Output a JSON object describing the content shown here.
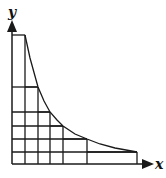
{
  "diagram": {
    "type": "riemann-rectangles-under-decreasing-curve",
    "labels": {
      "y_axis": "y",
      "x_axis": "x"
    },
    "colors": {
      "stroke": "#1a1a1a",
      "background": "#ffffff"
    },
    "origin": [
      12,
      164
    ],
    "columns": [
      {
        "x0": 12,
        "x1": 25,
        "top": 35
      },
      {
        "x0": 25,
        "x1": 38,
        "top": 87
      },
      {
        "x0": 38,
        "x1": 50,
        "top": 112
      },
      {
        "x0": 50,
        "x1": 63,
        "top": 126
      },
      {
        "x0": 63,
        "x1": 87,
        "top": 139
      },
      {
        "x0": 87,
        "x1": 137,
        "top": 152
      }
    ],
    "curve_points": [
      [
        25,
        35
      ],
      [
        30,
        58
      ],
      [
        38,
        87
      ],
      [
        44,
        101
      ],
      [
        50,
        112
      ],
      [
        57,
        120
      ],
      [
        63,
        126
      ],
      [
        75,
        134
      ],
      [
        87,
        139
      ],
      [
        100,
        144
      ],
      [
        115,
        148
      ],
      [
        137,
        152
      ]
    ]
  }
}
